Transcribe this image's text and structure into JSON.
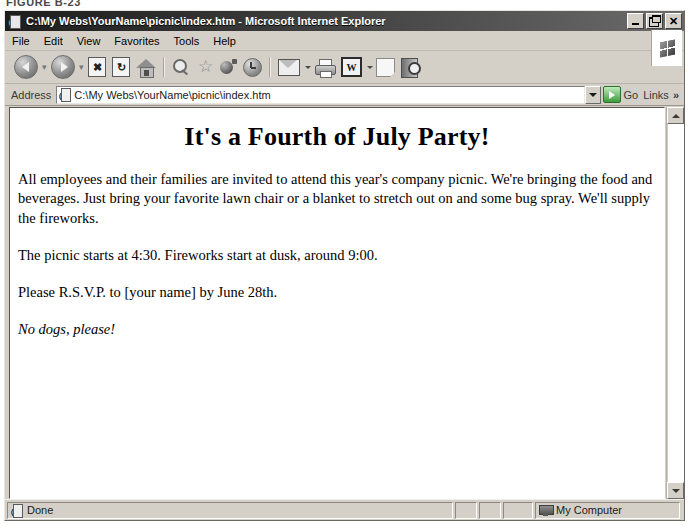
{
  "figure_caption": "FIGURE B-23",
  "window": {
    "title": "C:\\My Webs\\YourName\\picnic\\index.htm - Microsoft Internet Explorer",
    "icon": "page-globe-icon",
    "buttons": {
      "minimize": "Minimize",
      "restore": "Restore",
      "close": "Close"
    }
  },
  "menu": {
    "items": [
      {
        "label": "File"
      },
      {
        "label": "Edit"
      },
      {
        "label": "View"
      },
      {
        "label": "Favorites"
      },
      {
        "label": "Tools"
      },
      {
        "label": "Help"
      }
    ],
    "logo": "windows-flag-logo"
  },
  "toolbar": {
    "buttons": [
      {
        "name": "back-button",
        "label": "Back",
        "icon": "arrow-left-circle-icon",
        "has_dropdown": true
      },
      {
        "name": "forward-button",
        "label": "Forward",
        "icon": "arrow-right-circle-icon",
        "has_dropdown": true
      },
      {
        "name": "stop-button",
        "label": "Stop",
        "icon": "stop-x-icon",
        "has_dropdown": false
      },
      {
        "name": "refresh-button",
        "label": "Refresh",
        "icon": "refresh-icon",
        "has_dropdown": false
      },
      {
        "name": "home-button",
        "label": "Home",
        "icon": "home-icon",
        "has_dropdown": false
      },
      {
        "name": "search-button",
        "label": "Search",
        "icon": "search-icon",
        "has_dropdown": false
      },
      {
        "name": "favorites-button",
        "label": "Favorites",
        "icon": "star-icon",
        "has_dropdown": false
      },
      {
        "name": "media-button",
        "label": "Media",
        "icon": "media-icon",
        "has_dropdown": false
      },
      {
        "name": "history-button",
        "label": "History",
        "icon": "history-clock-icon",
        "has_dropdown": false
      },
      {
        "name": "mail-button",
        "label": "Mail",
        "icon": "mail-envelope-icon",
        "has_dropdown": true
      },
      {
        "name": "print-button",
        "label": "Print",
        "icon": "printer-icon",
        "has_dropdown": false
      },
      {
        "name": "edit-word-button",
        "label": "Edit",
        "icon": "word-w-icon",
        "has_dropdown": true
      },
      {
        "name": "discuss-button",
        "label": "Discuss",
        "icon": "blank-page-icon",
        "has_dropdown": false
      },
      {
        "name": "research-button",
        "label": "Research",
        "icon": "book-magnifier-icon",
        "has_dropdown": false
      }
    ],
    "word_icon_glyph": "W",
    "stop_icon_glyph": "✖",
    "refresh_icon_glyph": "↻",
    "star_icon_glyph": "☆"
  },
  "address": {
    "label": "Address",
    "value": "C:\\My Webs\\YourName\\picnic\\index.htm",
    "placeholder": "",
    "page_icon": "page-globe-icon",
    "dropdown_icon": "chevron-down-icon",
    "go_label": "Go",
    "go_icon": "go-arrow-icon",
    "links_label": "Links",
    "links_chevron": "»"
  },
  "page": {
    "heading": "It's a Fourth of July Party!",
    "paragraphs": [
      {
        "text": "All employees and their families are invited to attend this year's company picnic. We're bringing the food and beverages. Just bring your favorite lawn chair or a blanket to stretch out on and some bug spray. We'll supply the fireworks.",
        "style": "normal"
      },
      {
        "text": "The picnic starts at 4:30. Fireworks start at dusk, around 9:00.",
        "style": "normal"
      },
      {
        "text": "Please R.S.V.P. to [your name] by June 28th.",
        "style": "normal"
      },
      {
        "text": "No dogs, please!",
        "style": "italic"
      }
    ]
  },
  "scrollbar": {
    "up_arrow": "scroll-up-icon",
    "down_arrow": "scroll-down-icon"
  },
  "status_bar": {
    "message": "Done",
    "message_icon": "page-globe-icon",
    "zone": "My Computer",
    "zone_icon": "my-computer-icon"
  },
  "colors": {
    "window_face": "#d4d0c8",
    "title_bar_dark": "#1d1d1d",
    "title_bar_light": "#6b6b6b",
    "page_background": "#ffffff",
    "text": "#000000",
    "go_green": "#3d9b3d"
  }
}
